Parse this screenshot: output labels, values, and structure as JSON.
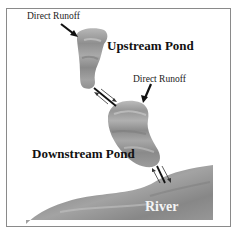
{
  "diagram": {
    "labels": {
      "runoff_upstream": "Direct Runoff",
      "runoff_downstream": "Direct Runoff",
      "upstream_pond": "Upstream Pond",
      "downstream_pond": "Downstream Pond",
      "river": "River"
    },
    "colors": {
      "water_base": "#9a9a9a",
      "water_light": "#bdbdbd",
      "water_dark": "#7f7f7f",
      "frame_border": "#8a8a8a",
      "arrow": "#111111"
    }
  }
}
